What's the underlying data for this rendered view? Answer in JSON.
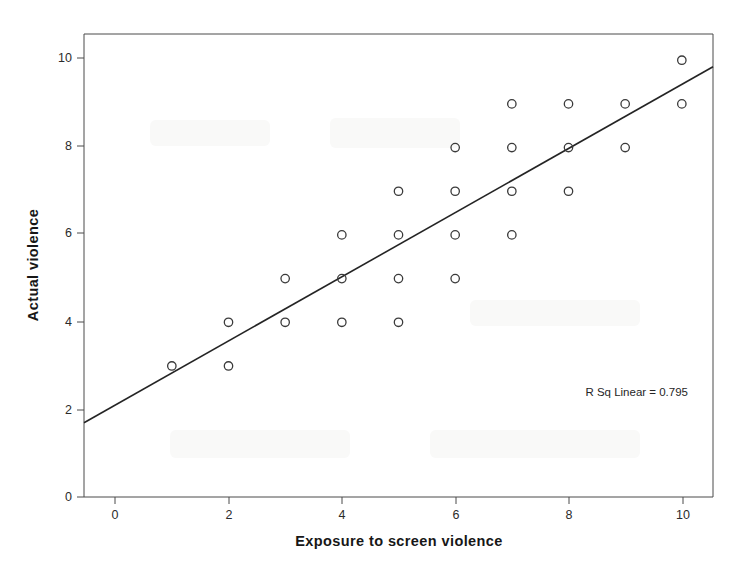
{
  "chart_data": {
    "type": "scatter",
    "title": "",
    "xlabel": "Exposure to screen violence",
    "ylabel": "Actual violence",
    "xlim": [
      -0.55,
      10.55
    ],
    "ylim": [
      0,
      10.6
    ],
    "xticks": [
      0,
      2,
      4,
      6,
      8,
      10
    ],
    "yticks": [
      0,
      2,
      4,
      6,
      8,
      10
    ],
    "xtick_labels": [
      "0",
      "2",
      "4",
      "6",
      "8",
      "10"
    ],
    "ytick_labels": [
      "0",
      "2",
      "4",
      "6",
      "8",
      "10"
    ],
    "grid": false,
    "legend": "none",
    "marker": "open-circle",
    "points": [
      {
        "x": 1,
        "y": 3
      },
      {
        "x": 2,
        "y": 3
      },
      {
        "x": 2,
        "y": 4
      },
      {
        "x": 3,
        "y": 4
      },
      {
        "x": 3,
        "y": 5
      },
      {
        "x": 4,
        "y": 4
      },
      {
        "x": 4,
        "y": 5
      },
      {
        "x": 4,
        "y": 6
      },
      {
        "x": 5,
        "y": 4
      },
      {
        "x": 5,
        "y": 5
      },
      {
        "x": 5,
        "y": 6
      },
      {
        "x": 5,
        "y": 7
      },
      {
        "x": 6,
        "y": 5
      },
      {
        "x": 6,
        "y": 6
      },
      {
        "x": 6,
        "y": 7
      },
      {
        "x": 6,
        "y": 8
      },
      {
        "x": 7,
        "y": 6
      },
      {
        "x": 7,
        "y": 7
      },
      {
        "x": 7,
        "y": 8
      },
      {
        "x": 7,
        "y": 9
      },
      {
        "x": 8,
        "y": 7
      },
      {
        "x": 8,
        "y": 8
      },
      {
        "x": 8,
        "y": 9
      },
      {
        "x": 9,
        "y": 8
      },
      {
        "x": 9,
        "y": 9
      },
      {
        "x": 10,
        "y": 9
      },
      {
        "x": 10,
        "y": 10
      }
    ],
    "fit_line": {
      "label": "R Sq Linear = 0.795",
      "r_squared": 0.795,
      "slope": 0.734,
      "intercept": 2.1,
      "x_start": -0.55,
      "y_start": 1.7,
      "x_end": 10.55,
      "y_end": 9.85
    }
  },
  "annotation": {
    "r_sq_text": "R Sq Linear = 0.795"
  },
  "colors": {
    "marker_stroke": "#3a3a3a",
    "fit_line": "#242424",
    "frame": "#4a4a4a",
    "text": "#1a1a1a",
    "background": "#ffffff"
  }
}
